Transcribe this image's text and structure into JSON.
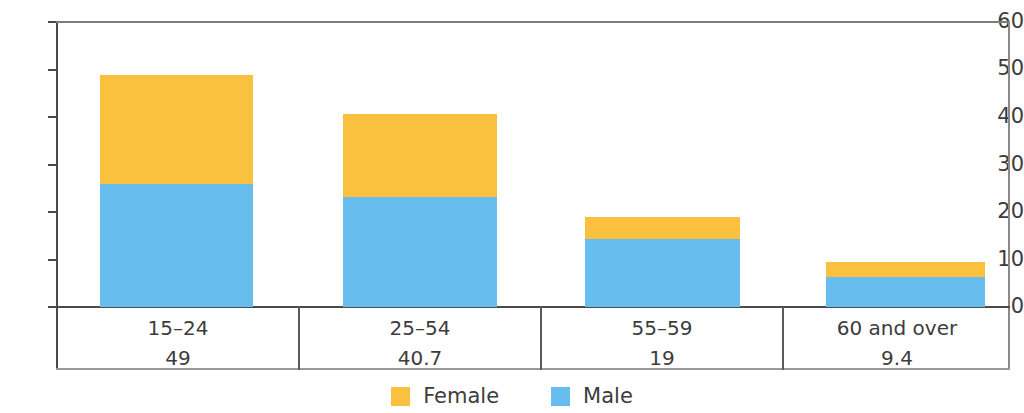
{
  "chart_data": {
    "type": "bar",
    "stacked": true,
    "title": "",
    "subtitle": "",
    "xlabel": "",
    "ylabel": "",
    "categories": [
      "15–24",
      "25–54",
      "55–59",
      "60 and over"
    ],
    "category_totals": [
      "49",
      "40.7",
      "19",
      "9.4"
    ],
    "series": [
      {
        "name": "Male",
        "color": "#67BDEE",
        "values": [
          25.8,
          23.1,
          14.2,
          6.4
        ]
      },
      {
        "name": "Female",
        "color": "#F9C13D",
        "values": [
          22.9,
          17.3,
          4.6,
          3.0
        ]
      }
    ],
    "stack_totals": [
      48.7,
      40.4,
      18.8,
      9.4
    ],
    "yticks": [
      "0",
      "10",
      "20",
      "30",
      "40",
      "50",
      "60"
    ],
    "ylim": [
      0,
      60
    ],
    "grid": false,
    "legend_position": "bottom"
  },
  "axis": {
    "ticks": [
      {
        "label": "60",
        "value": 60
      },
      {
        "label": "50",
        "value": 50
      },
      {
        "label": "40",
        "value": 40
      },
      {
        "label": "30",
        "value": 30
      },
      {
        "label": "20",
        "value": 20
      },
      {
        "label": "10",
        "value": 10
      },
      {
        "label": "0",
        "value": 0
      }
    ]
  },
  "legend": {
    "items": [
      {
        "label": "Female",
        "color": "#F9C13D"
      },
      {
        "label": "Male",
        "color": "#67BDEE"
      }
    ]
  },
  "colors": {
    "female": "#F9C13D",
    "male": "#67BDEE",
    "axis": "#4a4a4a",
    "text": "#3c3c3c",
    "background": "#ffffff"
  }
}
